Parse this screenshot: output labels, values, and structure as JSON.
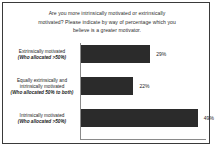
{
  "chart_data": {
    "type": "bar",
    "orientation": "horizontal",
    "title": "Are you more intrinsically motivated or extrinsically motivated? Please indicate by way of percentage which you believe is a greater motivator.",
    "title_lines": [
      "Are you more intrinsically motivated or extrinsically",
      "motivated? Please indicate by way of percentage which you",
      "believe is a greater motivator."
    ],
    "categories": [
      "Extrinsically motivated (Who allocated >50%)",
      "Equally extrinsically and intrinsically motivated (Who allocated 50% to both)",
      "Intrinsically motivated (Who allocated >50%)"
    ],
    "values": [
      29,
      22,
      49
    ],
    "value_labels": [
      "29%",
      "22%",
      "49%"
    ],
    "xlabel": "",
    "ylabel": "",
    "xlim": [
      0,
      52
    ],
    "grid": false,
    "legend": false,
    "bar_color": "#2b2b2b",
    "axis_color": "#8a8a8a",
    "bars": [
      {
        "label_lines": [
          {
            "text": "Extrinsically motivated",
            "style": "normal"
          },
          {
            "text": "(Who allocated >50%)",
            "style": "bold-italic"
          }
        ],
        "value": 29,
        "value_label": "29%"
      },
      {
        "label_lines": [
          {
            "text": "Equally extrinsically and",
            "style": "normal"
          },
          {
            "text": "intrinsically motivated",
            "style": "normal"
          },
          {
            "text": "(Who allocated 50% to both)",
            "style": "bold-italic"
          }
        ],
        "value": 22,
        "value_label": "22%"
      },
      {
        "label_lines": [
          {
            "text": "Intrinsically motivated",
            "style": "normal"
          },
          {
            "text": "(Who allocated >50%)",
            "style": "bold-italic"
          }
        ],
        "value": 49,
        "value_label": "49%"
      }
    ]
  }
}
